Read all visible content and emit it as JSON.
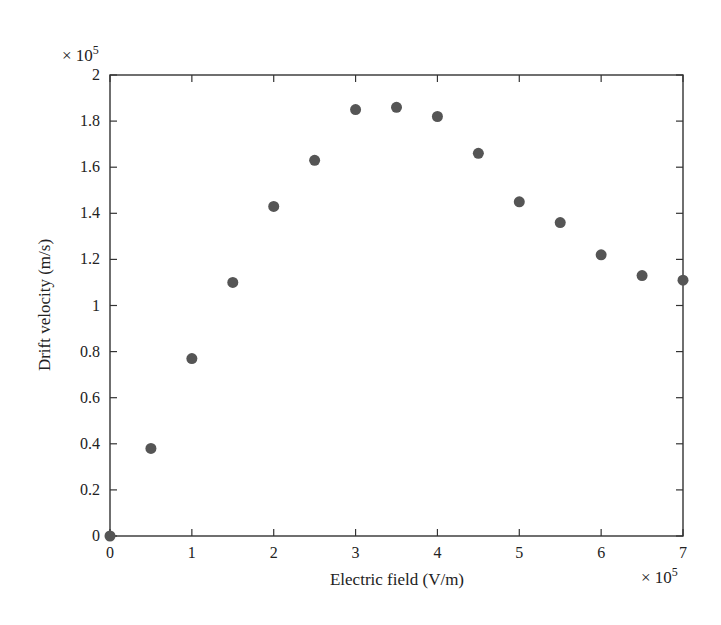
{
  "chart_data": {
    "type": "scatter",
    "title": "",
    "xlabel": "Electric field (V/m)",
    "ylabel": "Drift velocity (m/s)",
    "x_multiplier_label": "× 10",
    "x_multiplier_exp": "5",
    "y_multiplier_label": "× 10",
    "y_multiplier_exp": "5",
    "xlim": [
      0,
      7
    ],
    "ylim": [
      0,
      2
    ],
    "x_ticks": [
      0,
      1,
      2,
      3,
      4,
      5,
      6,
      7
    ],
    "x_tick_labels": [
      "0",
      "1",
      "2",
      "3",
      "4",
      "5",
      "6",
      "7"
    ],
    "y_ticks": [
      0,
      0.2,
      0.4,
      0.6,
      0.8,
      1.0,
      1.2,
      1.4,
      1.6,
      1.8,
      2.0
    ],
    "y_tick_labels": [
      "0",
      "0.2",
      "0.4",
      "0.6",
      "0.8",
      "1",
      "1.2",
      "1.4",
      "1.6",
      "1.8",
      "2"
    ],
    "grid": false,
    "legend": null,
    "series": [
      {
        "name": "Drift velocity",
        "marker": "circle",
        "color": "#555555",
        "x": [
          0,
          0.5,
          1.0,
          1.5,
          2.0,
          2.5,
          3.0,
          3.5,
          4.0,
          4.5,
          5.0,
          5.5,
          6.0,
          6.5,
          7.0
        ],
        "y": [
          0,
          0.38,
          0.77,
          1.1,
          1.43,
          1.63,
          1.85,
          1.86,
          1.82,
          1.66,
          1.45,
          1.36,
          1.22,
          1.13,
          1.11
        ]
      }
    ]
  },
  "layout": {
    "plot_left": 110,
    "plot_right": 683,
    "plot_top": 75,
    "plot_bottom": 536
  }
}
